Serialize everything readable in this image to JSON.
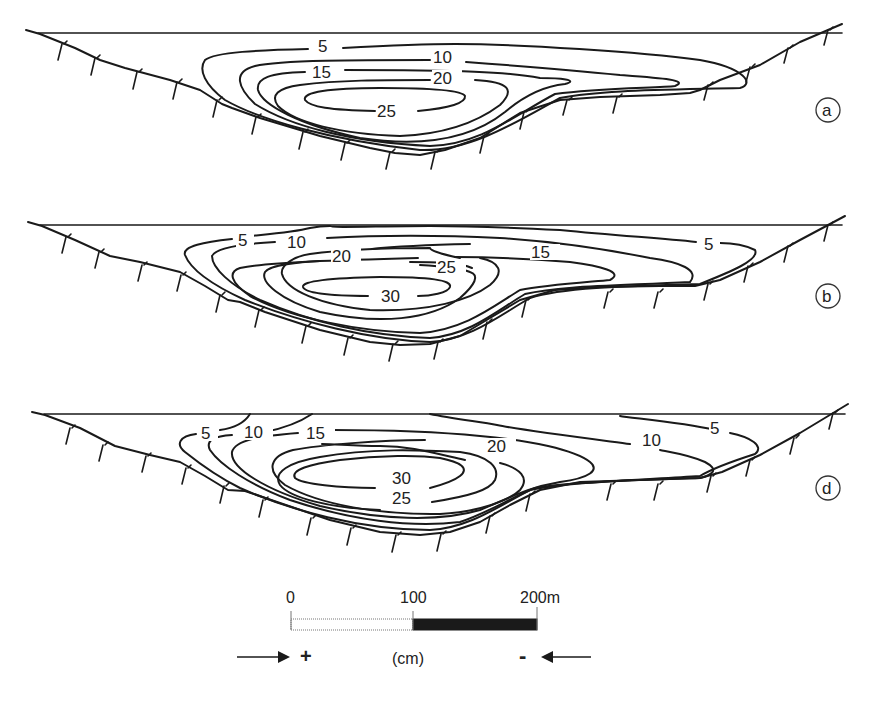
{
  "figure": {
    "panels": [
      {
        "id": "a",
        "label": "a",
        "contour_labels": [
          "5",
          "10",
          "15",
          "20",
          "25"
        ]
      },
      {
        "id": "b",
        "label": "b",
        "contour_labels": [
          "5",
          "10",
          "15",
          "20",
          "25",
          "30",
          "5"
        ]
      },
      {
        "id": "d",
        "label": "d",
        "contour_labels": [
          "5",
          "10",
          "15",
          "20",
          "30",
          "25",
          "10",
          "5"
        ]
      }
    ],
    "scale_bar": {
      "tick_0": "0",
      "tick_100": "100",
      "tick_200": "200m",
      "fill_left": "#ffffff",
      "fill_right": "#1a1a1a"
    },
    "legend": {
      "plus": "+",
      "unit": "(cm)",
      "minus": "-"
    }
  }
}
